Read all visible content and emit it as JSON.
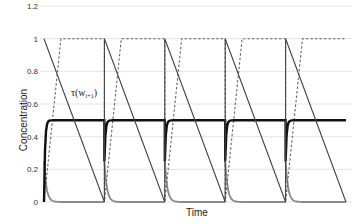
{
  "chart_data": {
    "type": "line",
    "title": "",
    "xlabel": "Time",
    "ylabel": "Concentration",
    "ylim": [
      0,
      1.2
    ],
    "yticks": [
      "0",
      "0.2",
      "0.4",
      "0.6",
      "0.8",
      "1",
      "1.2"
    ],
    "grid": true,
    "legend": "none",
    "periods": 5,
    "annotations": [
      {
        "text": "τ(w",
        "sub": "i+1",
        "close": ")",
        "near": "solid descending line, first period"
      }
    ],
    "series": [
      {
        "name": "tau_sawtooth",
        "style": "solid thin dark gray",
        "description": "Starts at 1 at each period start, decreases linearly to 0 at period end, jumps vertically back to 1",
        "x": [
          0,
          1,
          1,
          2,
          2,
          3,
          3,
          4,
          4,
          5
        ],
        "y": [
          1,
          0,
          1,
          0,
          1,
          0,
          1,
          0,
          1,
          0
        ]
      },
      {
        "name": "dashed_ramp",
        "style": "dashed gray",
        "description": "Rises from 0 to 1 within first ~28% of each period, holds at 1 until period end, drops to 0",
        "x": [
          0,
          0.28,
          1,
          1,
          1.28,
          2,
          2,
          2.28,
          3,
          3,
          3.28,
          4,
          4,
          4.28,
          5
        ],
        "y": [
          0,
          1,
          1,
          0,
          1,
          1,
          0,
          1,
          1,
          0,
          1,
          1,
          0,
          1,
          1
        ]
      },
      {
        "name": "thick_black",
        "style": "solid thick black",
        "description": "Rises rapidly to ~0.5 and plateaus; dips to ~0.25 at each period boundary then recovers",
        "plateau": 0.5,
        "dip": 0.25
      },
      {
        "name": "gray_decay",
        "style": "solid medium gray",
        "description": "Starts ~0.25 at each period start, decays quickly to ~0",
        "start": 0.25,
        "end": 0.0
      }
    ]
  }
}
